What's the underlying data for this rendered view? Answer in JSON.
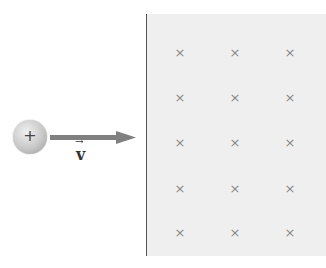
{
  "diagram": {
    "charge": {
      "sign": "+",
      "label": "positive charge"
    },
    "velocity": {
      "symbol": "v",
      "vector_arrow": "→",
      "color": "#808080"
    },
    "field": {
      "direction": "into-page",
      "marker": "×",
      "rows": 5,
      "cols": 3,
      "positions_x": [
        180,
        235,
        290
      ],
      "positions_y": [
        53,
        98,
        143,
        189,
        233
      ],
      "background": "#efefef"
    }
  }
}
